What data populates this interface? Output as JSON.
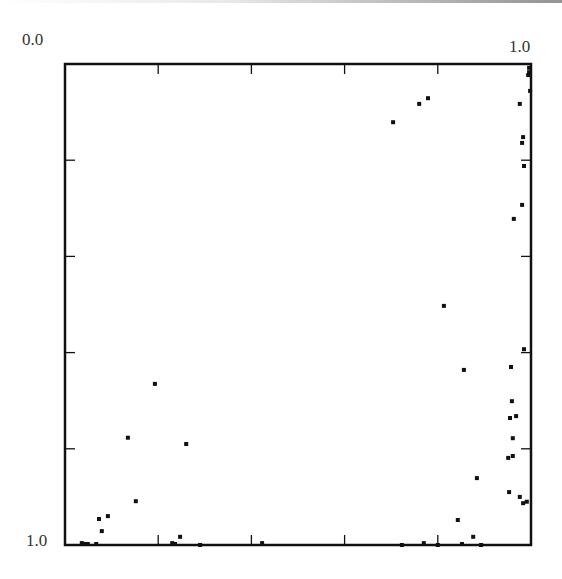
{
  "chart_data": {
    "type": "scatter",
    "title": "",
    "xlabel": "",
    "ylabel": "",
    "xlim": [
      0.0,
      1.0
    ],
    "ylim": [
      0.0,
      1.0
    ],
    "y_inverted": true,
    "grid": false,
    "legend": null,
    "tick_labels": {
      "x_start": "0.0",
      "x_end": "1.0",
      "y_end": "1.0"
    },
    "x_ticks": [
      0.2,
      0.4,
      0.6,
      0.8
    ],
    "y_ticks": [
      0.2,
      0.4,
      0.6,
      0.8
    ],
    "points": [
      {
        "x": 0.996,
        "y": 0.008
      },
      {
        "x": 0.996,
        "y": 0.017
      },
      {
        "x": 0.994,
        "y": 0.023
      },
      {
        "x": 0.998,
        "y": 0.056
      },
      {
        "x": 0.976,
        "y": 0.083
      },
      {
        "x": 0.704,
        "y": 0.121
      },
      {
        "x": 0.76,
        "y": 0.083
      },
      {
        "x": 0.779,
        "y": 0.071
      },
      {
        "x": 0.983,
        "y": 0.152
      },
      {
        "x": 0.981,
        "y": 0.164
      },
      {
        "x": 0.985,
        "y": 0.212
      },
      {
        "x": 0.981,
        "y": 0.293
      },
      {
        "x": 0.963,
        "y": 0.322
      },
      {
        "x": 0.813,
        "y": 0.503
      },
      {
        "x": 0.985,
        "y": 0.593
      },
      {
        "x": 0.957,
        "y": 0.63
      },
      {
        "x": 0.856,
        "y": 0.636
      },
      {
        "x": 0.959,
        "y": 0.701
      },
      {
        "x": 0.955,
        "y": 0.736
      },
      {
        "x": 0.968,
        "y": 0.732
      },
      {
        "x": 0.961,
        "y": 0.778
      },
      {
        "x": 0.951,
        "y": 0.819
      },
      {
        "x": 0.961,
        "y": 0.815
      },
      {
        "x": 0.884,
        "y": 0.861
      },
      {
        "x": 0.953,
        "y": 0.89
      },
      {
        "x": 0.976,
        "y": 0.9
      },
      {
        "x": 0.983,
        "y": 0.913
      },
      {
        "x": 0.991,
        "y": 0.91
      },
      {
        "x": 0.843,
        "y": 0.948
      },
      {
        "x": 0.876,
        "y": 0.983
      },
      {
        "x": 0.893,
        "y": 1.0
      },
      {
        "x": 0.77,
        "y": 0.996
      },
      {
        "x": 0.8,
        "y": 1.0
      },
      {
        "x": 0.852,
        "y": 0.998
      },
      {
        "x": 0.723,
        "y": 1.0
      },
      {
        "x": 0.193,
        "y": 0.665
      },
      {
        "x": 0.135,
        "y": 0.777
      },
      {
        "x": 0.26,
        "y": 0.79
      },
      {
        "x": 0.152,
        "y": 0.909
      },
      {
        "x": 0.073,
        "y": 0.946
      },
      {
        "x": 0.092,
        "y": 0.94
      },
      {
        "x": 0.079,
        "y": 0.971
      },
      {
        "x": 0.247,
        "y": 0.983
      },
      {
        "x": 0.036,
        "y": 0.996
      },
      {
        "x": 0.043,
        "y": 0.998
      },
      {
        "x": 0.049,
        "y": 0.998
      },
      {
        "x": 0.067,
        "y": 0.998
      },
      {
        "x": 0.23,
        "y": 0.996
      },
      {
        "x": 0.236,
        "y": 0.998
      },
      {
        "x": 0.29,
        "y": 1.0
      },
      {
        "x": 0.423,
        "y": 0.996
      }
    ]
  },
  "labels": {
    "x_start": "0.0",
    "x_end": "1.0",
    "y_end": "1.0"
  },
  "colors": {
    "axis": "#111111",
    "point": "#111111",
    "text": "#333333"
  }
}
